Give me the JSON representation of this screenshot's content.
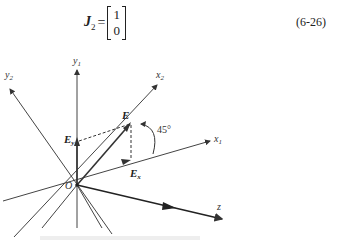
{
  "equation": {
    "lhs_symbol": "J",
    "lhs_subscript": "2",
    "equals": "=",
    "matrix": [
      "1",
      "0"
    ],
    "number": "(6-26)"
  },
  "diagram": {
    "origin_label": "O",
    "axes": [
      {
        "name": "y1",
        "label": "y",
        "sub": "1"
      },
      {
        "name": "y2",
        "label": "y",
        "sub": "2"
      },
      {
        "name": "x1",
        "label": "x",
        "sub": "1"
      },
      {
        "name": "x2",
        "label": "x",
        "sub": "2"
      },
      {
        "name": "z",
        "label": "z",
        "sub": ""
      }
    ],
    "vectors": {
      "E": "E",
      "Ex": {
        "label": "E",
        "sub": "x"
      },
      "Ey": {
        "label": "E",
        "sub": "y"
      }
    },
    "angle_label": "45°"
  }
}
